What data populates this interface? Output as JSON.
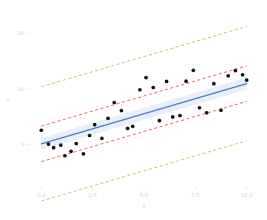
{
  "chart_data": {
    "type": "scatter",
    "title": "",
    "xlabel": "x",
    "ylabel": "y",
    "xlim": [
      -0.55,
      10.55
    ],
    "ylim": [
      -7.5,
      23.5
    ],
    "xticks": [
      0.0,
      2.5,
      5.0,
      7.5,
      10.0
    ],
    "xticklabels": [
      "0.0",
      "2.5",
      "5.0",
      "7.5",
      "10.0"
    ],
    "yticks": [
      0,
      10,
      20
    ],
    "yticklabels": [
      "0",
      "10",
      "20"
    ],
    "grid": false,
    "legend": null,
    "series": [
      {
        "name": "observations",
        "type": "scatter",
        "marker": "circle",
        "color": "#111111",
        "x": [
          0.0,
          0.35,
          0.6,
          0.95,
          1.15,
          1.45,
          1.7,
          2.05,
          2.35,
          2.6,
          2.95,
          3.25,
          3.55,
          3.9,
          4.2,
          4.45,
          4.8,
          5.1,
          5.45,
          5.75,
          6.1,
          6.4,
          6.75,
          7.05,
          7.4,
          7.7,
          8.05,
          8.4,
          8.75,
          9.1,
          9.45,
          9.8,
          10.0
        ],
        "y": [
          2.55,
          0.05,
          -0.6,
          -0.15,
          -2.05,
          -1.25,
          0.15,
          -1.7,
          1.6,
          3.55,
          1.1,
          4.7,
          7.55,
          6.1,
          2.9,
          3.25,
          9.85,
          12.05,
          10.25,
          4.3,
          11.35,
          4.95,
          5.2,
          11.4,
          13.35,
          6.6,
          5.7,
          10.95,
          6.15,
          12.35,
          13.3,
          12.55,
          11.6
        ]
      },
      {
        "name": "fitted regression line",
        "type": "line",
        "color": "#4b7fc4",
        "style": "solid",
        "x": [
          0.0,
          10.0
        ],
        "y": [
          0.1,
          10.95
        ]
      },
      {
        "name": "confidence interval band",
        "type": "area",
        "color": "#6f9ad3",
        "opacity": 0.16,
        "x": [
          0.0,
          10.0
        ],
        "y_lower": [
          -0.95,
          9.85
        ],
        "y_upper": [
          1.15,
          12.05
        ]
      },
      {
        "name": "inner prediction band upper",
        "type": "line",
        "color": "#e8504a",
        "style": "dashed",
        "x": [
          0.0,
          10.0
        ],
        "y": [
          3.3,
          14.15
        ]
      },
      {
        "name": "inner prediction band lower",
        "type": "line",
        "color": "#e8504a",
        "style": "dashed",
        "x": [
          0.0,
          10.0
        ],
        "y": [
          -3.1,
          7.75
        ]
      },
      {
        "name": "outer prediction band upper",
        "type": "line",
        "color": "#8fd14f",
        "style": "dashed",
        "x": [
          0.0,
          10.0
        ],
        "y": [
          10.4,
          21.25
        ]
      },
      {
        "name": "outer prediction band lower",
        "type": "line",
        "color": "#8fd14f",
        "style": "dashed",
        "x": [
          0.0,
          10.0
        ],
        "y": [
          -10.2,
          0.65
        ]
      }
    ]
  },
  "axes": {
    "x_title": "x",
    "y_title": "y",
    "x_tick_labels": [
      "0.0",
      "2.5",
      "5.0",
      "7.5",
      "10.0"
    ],
    "y_tick_labels": [
      "0",
      "10",
      "20"
    ]
  },
  "colors": {
    "point": "#111111",
    "fit_line": "#4b7fc4",
    "ci_band": "#6f9ad3",
    "inner_band": "#e8504a",
    "outer_band": "#8fd14f",
    "tick_text": "#cfcfd6",
    "background": "#ffffff"
  }
}
